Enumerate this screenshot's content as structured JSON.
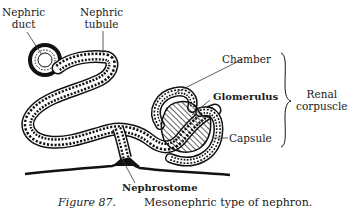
{
  "figure": {
    "labels": {
      "nephric_duct": [
        "Nephric",
        "duct"
      ],
      "nephric_tubule": [
        "Nephric",
        "tubule"
      ],
      "chamber": "Chamber",
      "glomerulus": "Glomerulus",
      "capsule": "Capsule",
      "renal_corpuscle": [
        "Renal",
        "corpuscle"
      ],
      "nephrostome": "Nephrostome"
    },
    "caption": {
      "figure_number": "Figure 87.",
      "text": "Mesonephric type of nephron."
    }
  }
}
